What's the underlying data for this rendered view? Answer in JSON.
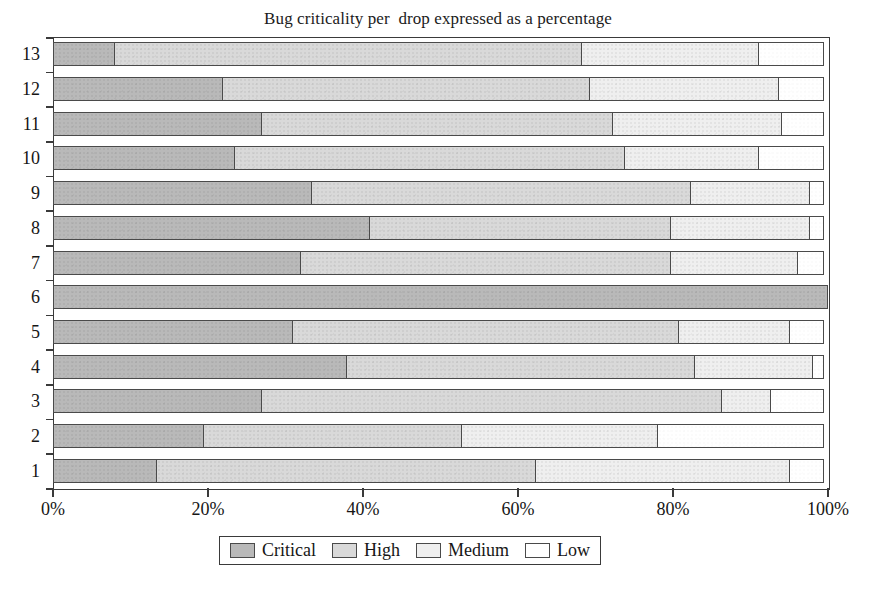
{
  "chart_data": {
    "type": "bar",
    "orientation": "horizontal",
    "stacked": true,
    "normalized": "percent",
    "title": "Bug criticality per  drop expressed as a percentage",
    "xlabel": "",
    "ylabel": "",
    "xlim": [
      0,
      100
    ],
    "xticks": [
      0,
      20,
      40,
      60,
      80,
      100
    ],
    "xtick_labels": [
      "0%",
      "20%",
      "40%",
      "60%",
      "80%",
      "100%"
    ],
    "grid": false,
    "legend_position": "bottom",
    "categories": [
      "1",
      "2",
      "3",
      "4",
      "5",
      "6",
      "7",
      "8",
      "9",
      "10",
      "11",
      "12",
      "13"
    ],
    "series": [
      {
        "name": "Critical",
        "color": "#b9b9b9",
        "values": [
          13.5,
          19.5,
          27.0,
          38.0,
          31.0,
          100.0,
          32.0,
          41.0,
          33.5,
          23.5,
          27.0,
          22.0,
          8.0
        ]
      },
      {
        "name": "High",
        "color": "#d9d9d9",
        "values": [
          49.0,
          33.5,
          59.5,
          45.0,
          50.0,
          0.0,
          48.0,
          39.0,
          49.0,
          50.5,
          45.5,
          47.5,
          60.5
        ]
      },
      {
        "name": "Medium",
        "color": "#efefef",
        "values": [
          33.0,
          25.5,
          6.5,
          15.5,
          14.5,
          0.0,
          16.5,
          18.0,
          15.5,
          17.5,
          22.0,
          24.5,
          23.0
        ]
      },
      {
        "name": "Low",
        "color": "#ffffff",
        "values": [
          4.5,
          21.5,
          7.0,
          1.5,
          4.5,
          0.0,
          3.5,
          2.0,
          2.0,
          8.5,
          5.5,
          6.0,
          8.5
        ]
      }
    ],
    "cumulative_boundaries": [
      {
        "category": "1",
        "critical_end": 13.5,
        "high_end": 62.5,
        "medium_end": 95.5
      },
      {
        "category": "2",
        "critical_end": 19.5,
        "high_end": 53.0,
        "medium_end": 78.5
      },
      {
        "category": "3",
        "critical_end": 27.0,
        "high_end": 86.5,
        "medium_end": 93.0
      },
      {
        "category": "4",
        "critical_end": 38.0,
        "high_end": 83.0,
        "medium_end": 98.5
      },
      {
        "category": "5",
        "critical_end": 31.0,
        "high_end": 81.0,
        "medium_end": 95.5
      },
      {
        "category": "6",
        "critical_end": 100.0,
        "high_end": 100.0,
        "medium_end": 100.0
      },
      {
        "category": "7",
        "critical_end": 32.0,
        "high_end": 80.0,
        "medium_end": 96.5
      },
      {
        "category": "8",
        "critical_end": 41.0,
        "high_end": 80.0,
        "medium_end": 98.0
      },
      {
        "category": "9",
        "critical_end": 33.5,
        "high_end": 82.5,
        "medium_end": 98.0
      },
      {
        "category": "10",
        "critical_end": 23.5,
        "high_end": 74.0,
        "medium_end": 91.5
      },
      {
        "category": "11",
        "critical_end": 27.0,
        "high_end": 72.5,
        "medium_end": 94.5
      },
      {
        "category": "12",
        "critical_end": 22.0,
        "high_end": 69.5,
        "medium_end": 94.0
      },
      {
        "category": "13",
        "critical_end": 8.0,
        "high_end": 68.5,
        "medium_end": 91.5
      }
    ]
  },
  "legend": {
    "items": [
      {
        "label": "Critical",
        "swatch": "#b9b9b9"
      },
      {
        "label": "High",
        "swatch": "#d9d9d9"
      },
      {
        "label": "Medium",
        "swatch": "#efefef"
      },
      {
        "label": "Low",
        "swatch": "#ffffff"
      }
    ]
  }
}
